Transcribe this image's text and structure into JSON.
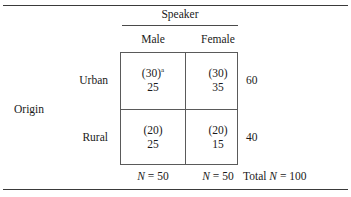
{
  "table": {
    "column_spanner": "Speaker",
    "column_headers": [
      "Male",
      "Female"
    ],
    "stub_title": "Origin",
    "row_headers": [
      "Urban",
      "Rural"
    ],
    "cells": [
      [
        {
          "expected": "(30)",
          "footnote_marker": "a",
          "observed": "25"
        },
        {
          "expected": "(30)",
          "footnote_marker": "",
          "observed": "35"
        }
      ],
      [
        {
          "expected": "(20)",
          "footnote_marker": "",
          "observed": "25"
        },
        {
          "expected": "(20)",
          "footnote_marker": "",
          "observed": "15"
        }
      ]
    ],
    "row_totals": [
      "60",
      "40"
    ],
    "column_totals": [
      {
        "prefix": "",
        "symbol": "N",
        "eq": " = ",
        "value": "50"
      },
      {
        "prefix": "",
        "symbol": "N",
        "eq": " = ",
        "value": "50"
      }
    ],
    "grand_total": {
      "prefix": "Total ",
      "symbol": "N",
      "eq": " = ",
      "value": "100"
    }
  },
  "chart_data": {
    "type": "table",
    "title": "",
    "row_variable": "Origin",
    "column_variable": "Speaker",
    "categories": [
      "Male",
      "Female"
    ],
    "rows": [
      "Urban",
      "Rural"
    ],
    "series": [
      {
        "name": "Urban",
        "observed": [
          25,
          35
        ],
        "expected": [
          30,
          30
        ],
        "total": 60
      },
      {
        "name": "Rural",
        "observed": [
          25,
          15
        ],
        "expected": [
          20,
          20
        ],
        "total": 40
      }
    ],
    "column_totals": [
      50,
      50
    ],
    "grand_total": 100
  }
}
